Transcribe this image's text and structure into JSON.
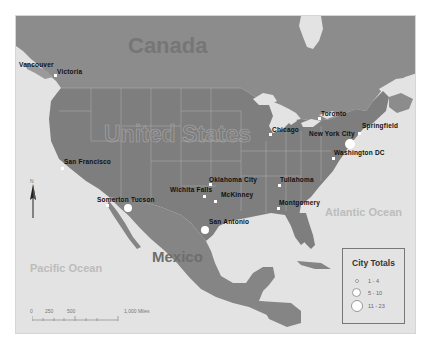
{
  "map": {
    "countries": {
      "canada": "Canada",
      "united_states": "United States",
      "mexico": "Mexico"
    },
    "oceans": {
      "pacific": "Pacific Ocean",
      "atlantic": "Atlantic Ocean"
    },
    "cities": [
      {
        "name": "Vancouver",
        "x": 30,
        "y": 174,
        "size": "small"
      },
      {
        "name": "Victoria",
        "x": 60,
        "y": 68,
        "size": "small"
      },
      {
        "name": "San Francisco",
        "x": 61,
        "y": 166,
        "size": "small"
      },
      {
        "name": "Somerton",
        "x": 104,
        "y": 205,
        "size": "small"
      },
      {
        "name": "Tucson",
        "x": 128,
        "y": 208,
        "size": "large"
      },
      {
        "name": "Wichita Falls",
        "x": 203,
        "y": 196,
        "size": "small"
      },
      {
        "name": "Oklahoma City",
        "x": 214,
        "y": 184,
        "size": "small"
      },
      {
        "name": "McKinney",
        "x": 215,
        "y": 201,
        "size": "small"
      },
      {
        "name": "San Antonio",
        "x": 204,
        "y": 228,
        "size": "large"
      },
      {
        "name": "Tullahoma",
        "x": 278,
        "y": 184,
        "size": "small"
      },
      {
        "name": "Montgomery",
        "x": 277,
        "y": 207,
        "size": "small"
      },
      {
        "name": "Chicago",
        "x": 269,
        "y": 133,
        "size": "small"
      },
      {
        "name": "Toronto",
        "x": 318,
        "y": 116,
        "size": "small"
      },
      {
        "name": "New York City",
        "x": 358,
        "y": 132,
        "size": "small"
      },
      {
        "name": "Springfield",
        "x": 359,
        "y": 131,
        "size": "small"
      },
      {
        "name": "Washington DC",
        "x": 332,
        "y": 157,
        "size": "small"
      },
      {
        "name": "Boston-area",
        "x": 349,
        "y": 143,
        "size": "large"
      }
    ],
    "city_labels": {
      "vancouver": "Vancouver",
      "victoria": "Victoria",
      "san_francisco": "San Francisco",
      "somerton_tucson": "Somerton Tucson",
      "wichita_falls": "Wichita Falls",
      "oklahoma_city": "Oklahoma City",
      "mckinney": "McKinney",
      "san_antonio": "San Antonio",
      "tullahoma": "Tullahoma",
      "montgomery": "Montgomery",
      "chicago": "Chicago",
      "toronto": "Toronto",
      "new_york_city": "New York City",
      "springfield": "Springfield",
      "washington_dc": "Washington DC"
    },
    "north_arrow": {
      "label": "N"
    },
    "scale_bar": {
      "ticks": [
        "0",
        "250",
        "500",
        "1,000 Miles"
      ]
    },
    "legend": {
      "title": "City Totals",
      "items": [
        {
          "label": "1 - 4",
          "size": "small"
        },
        {
          "label": "5 - 10",
          "size": "medium"
        },
        {
          "label": "11 - 23",
          "size": "large"
        }
      ]
    },
    "colors": {
      "ocean": "#e3e3e3",
      "canada_land": "#8c8c8c",
      "us_land": "#7e7e7e",
      "mexico_land": "#858585",
      "borders": "#a8a8a8",
      "marker": "#ffffff"
    }
  }
}
